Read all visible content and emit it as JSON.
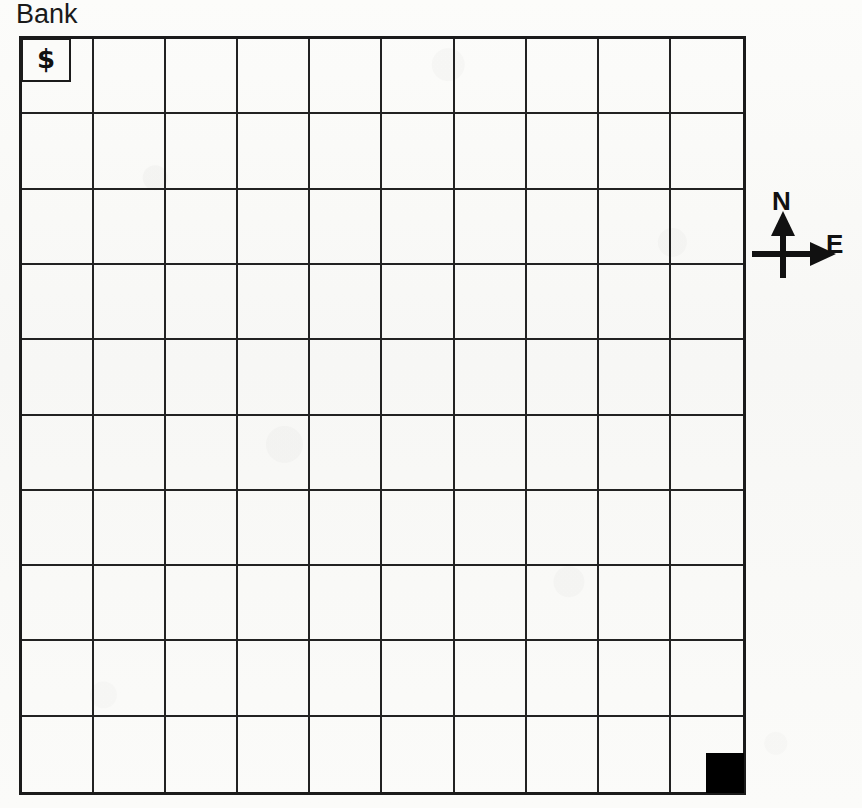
{
  "map": {
    "title": "Bank",
    "grid": {
      "columns": 10,
      "rows": 10,
      "line_color": "#222222",
      "border_color": "#1b1b1b",
      "background_color": "#fbfbf9"
    },
    "features": [
      {
        "name": "bank",
        "symbol": "$",
        "label": "Bank",
        "row": 0,
        "column": 0,
        "style": "outlined-sub-box",
        "color": "#111111"
      },
      {
        "name": "goal-marker",
        "symbol": "",
        "label": "",
        "row": 9,
        "column": 9,
        "style": "filled-square",
        "color": "#000000"
      }
    ]
  },
  "compass": {
    "north_label": "N",
    "east_label": "E",
    "color": "#111111"
  }
}
